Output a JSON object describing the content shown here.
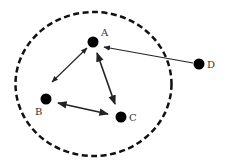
{
  "diagram": {
    "type": "network-graph",
    "boundary": {
      "shape": "ellipse",
      "style": "dashed",
      "cx": 93.5,
      "cy": 84,
      "rx": 78,
      "ry": 72,
      "stroke_color": "#111111",
      "stroke_width": 2.5
    },
    "nodes": [
      {
        "id": "A",
        "label": "A",
        "x": 93,
        "y": 42,
        "r": 5.5,
        "label_x": 101,
        "label_y": 36,
        "inside_boundary": true
      },
      {
        "id": "B",
        "label": "B",
        "x": 46,
        "y": 99,
        "r": 5.5,
        "label_x": 35,
        "label_y": 115,
        "inside_boundary": true
      },
      {
        "id": "C",
        "label": "C",
        "x": 121,
        "y": 117,
        "r": 5.5,
        "label_x": 129,
        "label_y": 121,
        "inside_boundary": true
      },
      {
        "id": "D",
        "label": "D",
        "x": 199,
        "y": 64,
        "r": 5.5,
        "label_x": 207,
        "label_y": 68,
        "inside_boundary": false
      }
    ],
    "edges": [
      {
        "from": "A",
        "to": "B",
        "direction": "bidirectional",
        "x1": 87,
        "y1": 48,
        "x2": 52,
        "y2": 82
      },
      {
        "from": "A",
        "to": "C",
        "direction": "bidirectional",
        "x1": 97,
        "y1": 53,
        "x2": 115,
        "y2": 104
      },
      {
        "from": "B",
        "to": "C",
        "direction": "bidirectional",
        "x1": 58,
        "y1": 103,
        "x2": 108,
        "y2": 114
      },
      {
        "from": "D",
        "to": "A",
        "direction": "unidirectional",
        "x1": 193,
        "y1": 63,
        "x2": 104,
        "y2": 47
      }
    ],
    "node_color": "#000000",
    "edge_color": "#222222"
  }
}
